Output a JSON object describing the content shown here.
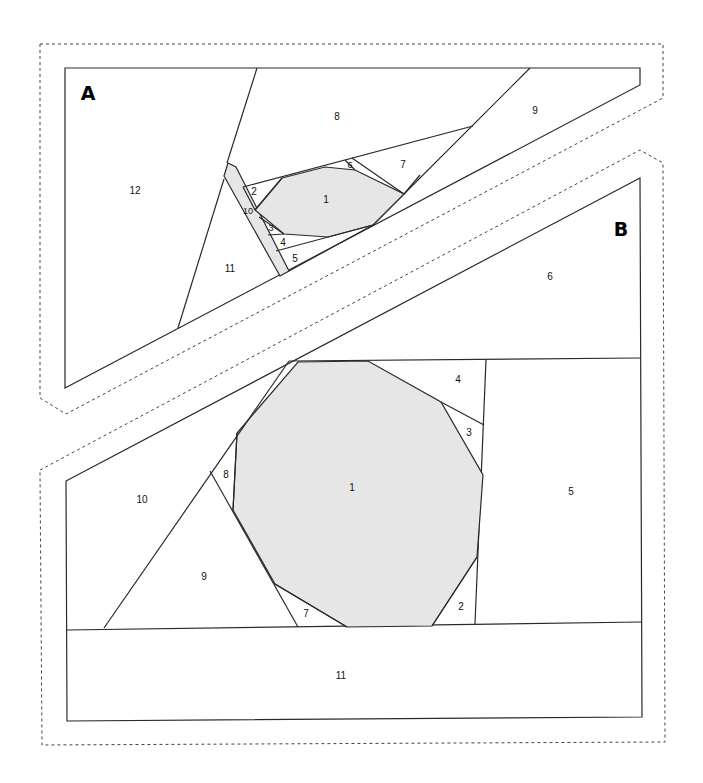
{
  "diagram": {
    "type": "foundation-paper-piecing-pattern",
    "accent_fill": "#e6e6e6",
    "line_color": "#2a2a2a",
    "sections": [
      {
        "id": "A",
        "label": "A",
        "pieces": [
          {
            "n": "1",
            "label": "1",
            "fabric": "center"
          },
          {
            "n": "2",
            "label": "2"
          },
          {
            "n": "3",
            "label": "3"
          },
          {
            "n": "4",
            "label": "4"
          },
          {
            "n": "5",
            "label": "5"
          },
          {
            "n": "6",
            "label": "6"
          },
          {
            "n": "7",
            "label": "7"
          },
          {
            "n": "8",
            "label": "8"
          },
          {
            "n": "9",
            "label": "9"
          },
          {
            "n": "10",
            "label": "10",
            "fabric": "center"
          },
          {
            "n": "11",
            "label": "11"
          },
          {
            "n": "12",
            "label": "12"
          }
        ]
      },
      {
        "id": "B",
        "label": "B",
        "pieces": [
          {
            "n": "1",
            "label": "1",
            "fabric": "center"
          },
          {
            "n": "2",
            "label": "2"
          },
          {
            "n": "3",
            "label": "3"
          },
          {
            "n": "4",
            "label": "4"
          },
          {
            "n": "5",
            "label": "5"
          },
          {
            "n": "6",
            "label": "6"
          },
          {
            "n": "7",
            "label": "7"
          },
          {
            "n": "8",
            "label": "8"
          },
          {
            "n": "9",
            "label": "9"
          },
          {
            "n": "10",
            "label": "10"
          },
          {
            "n": "11",
            "label": "11"
          }
        ]
      }
    ]
  }
}
